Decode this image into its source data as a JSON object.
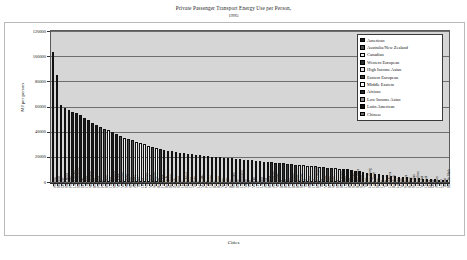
{
  "chart_data": {
    "type": "bar",
    "title": "Private Passenger Transport Energy Use per Person,",
    "subtitle": "1995",
    "xlabel": "Cities",
    "ylabel": "MJ per person",
    "ylim": [
      0,
      120000
    ],
    "ytick_values": [
      0,
      20000,
      40000,
      60000,
      80000,
      100000,
      120000
    ],
    "ytick_labels": [
      "0",
      "20000",
      "40000",
      "60000",
      "80000",
      "100000",
      "120000"
    ],
    "grid": true,
    "legend_position": "top-right",
    "legend": [
      {
        "label": "American",
        "color": "#1a1a1a"
      },
      {
        "label": "Australia/New Zealand",
        "color": "#4d4d4d"
      },
      {
        "label": "Canadian",
        "color": "#f2f2f2"
      },
      {
        "label": "Western European",
        "color": "#2b2b2b"
      },
      {
        "label": "High Income Asian",
        "color": "#e0e0e0"
      },
      {
        "label": "Eastern European",
        "color": "#3a3a3a"
      },
      {
        "label": "Middle Eastern",
        "color": "#ffffff"
      },
      {
        "label": "African",
        "color": "#262626"
      },
      {
        "label": "Low Income Asian",
        "color": "#8c8c8c"
      },
      {
        "label": "Latin American",
        "color": "#111111"
      },
      {
        "label": "Chinese",
        "color": "#6b6b6b"
      }
    ],
    "categories": [
      "Atlanta",
      "Houston",
      "Denver",
      "San Diego",
      "Phoenix",
      "Los Angeles",
      "San Francisco",
      "Detroit",
      "Chicago",
      "Washington",
      "Boston",
      "Portland",
      "Perth",
      "Brisbane",
      "Calgary",
      "Sacramento",
      "New York",
      "Melbourne",
      "Winnipeg",
      "Sydney",
      "Adelaide",
      "Toronto",
      "Ottawa",
      "Vancouver",
      "Montreal",
      "Wellington",
      "Riyadh",
      "Frankfurt",
      "Brussels",
      "Hamburg",
      "Zurich",
      "Stuttgart",
      "Oslo",
      "Dusseldorf",
      "Geneva",
      "Tel Aviv",
      "Lyon",
      "Marseille",
      "Paris",
      "Glasgow",
      "Ruhr",
      "Bologna",
      "Nantes",
      "Vienna",
      "Berne",
      "Stockholm",
      "Rome",
      "Copenhagen",
      "Milan",
      "Turin",
      "Madrid",
      "Graz",
      "London",
      "Athens",
      "Helsinki",
      "Amsterdam",
      "Newcastle",
      "Basel",
      "Berlin",
      "Prague",
      "Barcelona",
      "Budapest",
      "Singapore",
      "Tokyo",
      "Sapporo",
      "Osaka",
      "Kuala Lumpur",
      "Taipei",
      "Moscow",
      "Krakow",
      "Warsaw",
      "Seoul",
      "Hong Kong",
      "Curitiba",
      "Bogota",
      "Sao Paulo",
      "Buenos Aires",
      "Santiago",
      "Tehran",
      "Johannesburg",
      "Cape Town",
      "Harare",
      "Cairo",
      "Tunis",
      "Casablanca",
      "Bangkok",
      "Jakarta",
      "Manila",
      "Surabaya",
      "Beijing",
      "Shanghai",
      "Guangzhou",
      "Mumbai",
      "Chennai",
      "Delhi",
      "Dakar",
      "Abidjan",
      "Lagos",
      "Tianjin",
      "Ho Chi Minh"
    ],
    "values": [
      103000,
      85000,
      61000,
      59000,
      57500,
      56000,
      54500,
      53000,
      51000,
      49500,
      47000,
      45500,
      44000,
      42500,
      41000,
      39500,
      38000,
      36500,
      35000,
      34000,
      33000,
      32000,
      31000,
      30000,
      29000,
      28000,
      27000,
      26200,
      25600,
      25000,
      24400,
      23800,
      23300,
      22800,
      22300,
      21900,
      21500,
      21100,
      20800,
      20500,
      20200,
      19900,
      19600,
      19300,
      19000,
      18700,
      18400,
      18100,
      17800,
      17500,
      17200,
      16900,
      16600,
      16300,
      16000,
      15700,
      15400,
      15100,
      14800,
      14500,
      14200,
      13900,
      13600,
      13300,
      13000,
      12700,
      12400,
      12100,
      11800,
      11500,
      11200,
      10900,
      10600,
      10300,
      10000,
      9500,
      9000,
      8500,
      8000,
      7500,
      7000,
      6500,
      6000,
      5500,
      5200,
      4900,
      4600,
      4300,
      4000,
      3700,
      3400,
      3100,
      2900,
      2700,
      2500,
      2300,
      2100,
      1900,
      1700,
      1400
    ],
    "bar_colors": [
      "#1a1a1a",
      "#1a1a1a",
      "#1a1a1a",
      "#1a1a1a",
      "#1a1a1a",
      "#1a1a1a",
      "#1a1a1a",
      "#1a1a1a",
      "#1a1a1a",
      "#1a1a1a",
      "#1a1a1a",
      "#1a1a1a",
      "#4d4d4d",
      "#4d4d4d",
      "#f2f2f2",
      "#1a1a1a",
      "#1a1a1a",
      "#4d4d4d",
      "#f2f2f2",
      "#4d4d4d",
      "#4d4d4d",
      "#f2f2f2",
      "#f2f2f2",
      "#f2f2f2",
      "#f2f2f2",
      "#4d4d4d",
      "#ffffff",
      "#2b2b2b",
      "#2b2b2b",
      "#2b2b2b",
      "#2b2b2b",
      "#2b2b2b",
      "#2b2b2b",
      "#2b2b2b",
      "#2b2b2b",
      "#ffffff",
      "#2b2b2b",
      "#2b2b2b",
      "#2b2b2b",
      "#2b2b2b",
      "#2b2b2b",
      "#2b2b2b",
      "#2b2b2b",
      "#2b2b2b",
      "#2b2b2b",
      "#2b2b2b",
      "#2b2b2b",
      "#2b2b2b",
      "#2b2b2b",
      "#2b2b2b",
      "#2b2b2b",
      "#2b2b2b",
      "#2b2b2b",
      "#2b2b2b",
      "#2b2b2b",
      "#2b2b2b",
      "#2b2b2b",
      "#2b2b2b",
      "#2b2b2b",
      "#3a3a3a",
      "#2b2b2b",
      "#3a3a3a",
      "#e0e0e0",
      "#e0e0e0",
      "#e0e0e0",
      "#e0e0e0",
      "#8c8c8c",
      "#e0e0e0",
      "#3a3a3a",
      "#3a3a3a",
      "#3a3a3a",
      "#e0e0e0",
      "#e0e0e0",
      "#111111",
      "#111111",
      "#111111",
      "#111111",
      "#111111",
      "#ffffff",
      "#262626",
      "#262626",
      "#262626",
      "#ffffff",
      "#ffffff",
      "#ffffff",
      "#8c8c8c",
      "#8c8c8c",
      "#8c8c8c",
      "#8c8c8c",
      "#6b6b6b",
      "#6b6b6b",
      "#6b6b6b",
      "#8c8c8c",
      "#8c8c8c",
      "#8c8c8c",
      "#262626",
      "#262626",
      "#262626",
      "#6b6b6b",
      "#8c8c8c"
    ]
  }
}
